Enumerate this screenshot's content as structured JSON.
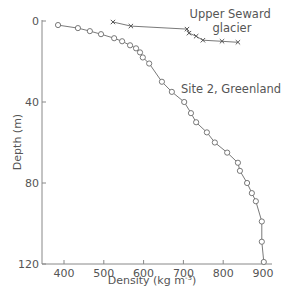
{
  "chart_data": {
    "type": "scatter",
    "title": "",
    "xlabel": "Density (kg m⁻³)",
    "xlabel_main": "Density (kg m",
    "xlabel_sup": "-3",
    "xlabel_end": ")",
    "ylabel": "Depth (m)",
    "xlim": [
      350,
      910
    ],
    "ylim": [
      120,
      0
    ],
    "y_inverted": true,
    "grid": false,
    "x_ticks": [
      400,
      500,
      600,
      700,
      800,
      900
    ],
    "y_ticks": [
      0,
      40,
      80,
      120
    ],
    "series": [
      {
        "name": "Site 2, Greenland",
        "marker": "circle",
        "x": [
          385,
          435,
          465,
          493,
          526,
          546,
          566,
          581,
          591,
          598,
          614,
          646,
          671,
          702,
          719,
          732,
          759,
          779,
          810,
          837,
          842,
          860,
          872,
          882,
          897,
          897,
          902
        ],
        "y": [
          2,
          3.5,
          5,
          6.5,
          8.5,
          10,
          12,
          13.5,
          15.5,
          18,
          21,
          30,
          35,
          40,
          45.5,
          50,
          55,
          60,
          65,
          70,
          74,
          80,
          85,
          89,
          99,
          109,
          119
        ]
      },
      {
        "name": "Upper Seward glacier",
        "marker": "x",
        "x": [
          523,
          568,
          709,
          714,
          732,
          749,
          797,
          837
        ],
        "y": [
          0.5,
          2.5,
          4,
          6,
          7.5,
          9.5,
          10,
          10.5
        ]
      }
    ],
    "annotations": [
      {
        "text_line1": "Upper Seward",
        "text_line2": "glacier",
        "near_series": "Upper Seward glacier"
      },
      {
        "text": "Site 2, Greenland",
        "near_series": "Site 2, Greenland"
      }
    ]
  }
}
